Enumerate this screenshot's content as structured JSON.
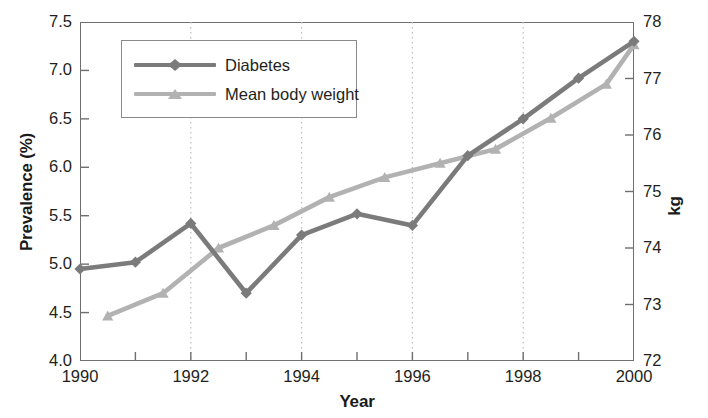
{
  "chart_data": {
    "type": "line",
    "title": "",
    "xlabel": "Year",
    "ylabel": "Prevalence (%)",
    "y2label": "kg",
    "xlim": [
      1990,
      2000
    ],
    "ylim": [
      4.0,
      7.5
    ],
    "y2lim": [
      72,
      78
    ],
    "grid": "vertical-dotted-major",
    "legend_position": "top-left-inside",
    "x_ticks_major": [
      1990,
      1992,
      1994,
      1996,
      1998,
      2000
    ],
    "x_ticks_minor": [
      1991,
      1993,
      1995,
      1997,
      1999
    ],
    "x_tick_labels": [
      "1990",
      "1992",
      "1994",
      "1996",
      "1998",
      "2000"
    ],
    "y_ticks": [
      4.0,
      4.5,
      5.0,
      5.5,
      6.0,
      6.5,
      7.0,
      7.5
    ],
    "y_tick_labels": [
      "4.0",
      "4.5",
      "5.0",
      "5.5",
      "6.0",
      "6.5",
      "7.0",
      "7.5"
    ],
    "y2_ticks": [
      72,
      73,
      74,
      75,
      76,
      77,
      78
    ],
    "y2_tick_labels": [
      "72",
      "73",
      "74",
      "75",
      "76",
      "77",
      "78"
    ],
    "series": [
      {
        "name": "Diabetes",
        "axis": "left",
        "color": "#7b7b7b",
        "marker": "diamond",
        "x": [
          1990,
          1991,
          1992,
          1993,
          1994,
          1995,
          1996,
          1997,
          1998,
          1999,
          2000
        ],
        "values": [
          4.95,
          5.02,
          5.42,
          4.7,
          5.3,
          5.52,
          5.4,
          6.12,
          6.5,
          6.92,
          7.3
        ]
      },
      {
        "name": "Mean body weight",
        "axis": "right",
        "color": "#b2b2b2",
        "marker": "triangle",
        "x": [
          1990.5,
          1991.5,
          1992.5,
          1993.5,
          1994.5,
          1995.5,
          1996.5,
          1997.5,
          1998.5,
          1999.5,
          2000.0
        ],
        "values": [
          72.8,
          73.2,
          74.0,
          74.4,
          74.9,
          75.25,
          75.5,
          75.75,
          76.3,
          76.9,
          77.6
        ]
      }
    ]
  },
  "axes": {
    "left_title": "Prevalence (%)",
    "right_title": "kg",
    "bottom_title": "Year"
  },
  "legend": {
    "items": [
      {
        "label": "Diabetes",
        "color": "#7b7b7b",
        "marker": "diamond"
      },
      {
        "label": "Mean body weight",
        "color": "#b2b2b2",
        "marker": "triangle"
      }
    ]
  },
  "colors": {
    "diabetes": "#7b7b7b",
    "body_weight": "#b2b2b2",
    "frame": "#6f6f6f",
    "grid": "#bdbdbd",
    "text": "#231f20"
  }
}
